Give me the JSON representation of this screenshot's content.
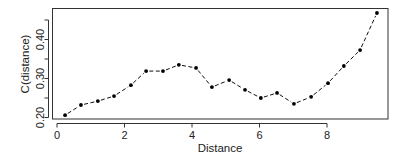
{
  "chart_data": {
    "type": "line",
    "title": "",
    "xlabel": "Distance",
    "ylabel": "C(distance)",
    "xlim": [
      0,
      9.6
    ],
    "ylim": [
      0.2,
      0.47
    ],
    "x_ticks": [
      0,
      2,
      4,
      6,
      8
    ],
    "x_tick_labels": [
      "0",
      "2",
      "4",
      "6",
      "8"
    ],
    "y_ticks": [
      0.2,
      0.25,
      0.3,
      0.35,
      0.4,
      0.45
    ],
    "y_tick_labels": [
      "0.20",
      "",
      "0.30",
      "",
      "0.40",
      ""
    ],
    "grid": false,
    "legend": null,
    "series": [
      {
        "name": "C(distance)",
        "style": "dashed line with points",
        "x": [
          0.24,
          0.71,
          1.21,
          1.69,
          2.19,
          2.64,
          3.14,
          3.61,
          4.12,
          4.59,
          5.1,
          5.57,
          6.04,
          6.52,
          7.02,
          7.53,
          8.03,
          8.5,
          8.98,
          9.48
        ],
        "values": [
          0.206,
          0.232,
          0.242,
          0.255,
          0.283,
          0.319,
          0.319,
          0.335,
          0.327,
          0.278,
          0.296,
          0.271,
          0.25,
          0.263,
          0.235,
          0.253,
          0.288,
          0.332,
          0.373,
          0.468
        ]
      }
    ]
  }
}
